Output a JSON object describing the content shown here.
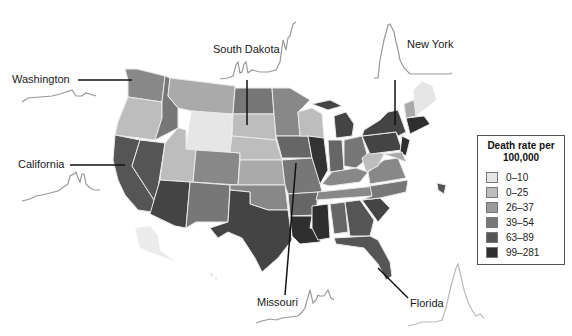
{
  "legend": {
    "title_line1": "Death rate per",
    "title_line2": "100,000",
    "bins": [
      {
        "label": "0–10",
        "color": "#e6e6e6"
      },
      {
        "label": "0–25",
        "color": "#bdbdbd"
      },
      {
        "label": "26–37",
        "color": "#9a9a9a"
      },
      {
        "label": "39–54",
        "color": "#777777"
      },
      {
        "label": "63–89",
        "color": "#555555"
      },
      {
        "label": "99–281",
        "color": "#2e2e2e"
      }
    ]
  },
  "callouts": [
    {
      "state": "Washington",
      "label": "Washington"
    },
    {
      "state": "South Dakota",
      "label": "South Dakota"
    },
    {
      "state": "New York",
      "label": "New York"
    },
    {
      "state": "California",
      "label": "California"
    },
    {
      "state": "Missouri",
      "label": "Missouri"
    },
    {
      "state": "Florida",
      "label": "Florida"
    }
  ],
  "sparklines": {
    "washington": "flat-low",
    "south_dakota": "late-surge",
    "new_york": "early-peak",
    "california": "mid-peak",
    "missouri": "late-rise",
    "florida": "mid-peak"
  }
}
